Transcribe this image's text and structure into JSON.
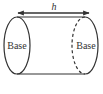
{
  "diagram": {
    "title": "",
    "shape": "cylinder",
    "dimension_label": "h",
    "left_base_label": "Base",
    "right_base_label": "Base",
    "stroke_color": "#333333",
    "background": "#ffffff"
  }
}
